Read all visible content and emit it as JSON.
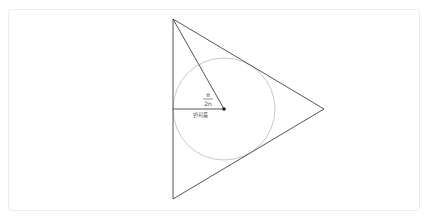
{
  "diagram": {
    "type": "geometry",
    "triangle": {
      "vertices": [
        [
          173,
          19
        ],
        [
          173,
          199
        ],
        [
          324,
          109
        ]
      ],
      "stroke": "#555555"
    },
    "incircle": {
      "center": [
        224,
        109
      ],
      "radius": 51,
      "stroke": "#c8c8c8"
    },
    "center_point": {
      "x": 224,
      "y": 109,
      "color": "#222222"
    },
    "lines": {
      "radius_line": {
        "from": [
          173,
          109
        ],
        "to": [
          224,
          109
        ]
      },
      "vertex_to_center": {
        "from": [
          173,
          19
        ],
        "to": [
          224,
          109
        ]
      }
    },
    "labels": {
      "angle_numerator": "π",
      "angle_denominator": "2n",
      "radius_label": "반지름"
    },
    "colors": {
      "line": "#555555",
      "circle": "#c8c8c8",
      "frame_border": "#ececec",
      "text": "#444444"
    }
  }
}
